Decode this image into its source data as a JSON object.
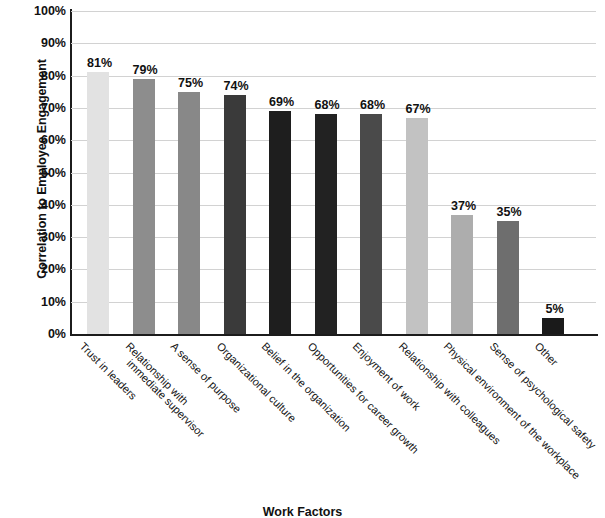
{
  "chart_data": {
    "type": "bar",
    "title": "",
    "xlabel": "Work Factors",
    "ylabel": "Correlation to Employee Engagement",
    "ylim": [
      0,
      100
    ],
    "ytick_labels": [
      "100%",
      "90%",
      "80%",
      "70%",
      "60%",
      "50%",
      "40%",
      "30%",
      "20%",
      "10%",
      "0%"
    ],
    "ytick_values": [
      100,
      90,
      80,
      70,
      60,
      50,
      40,
      30,
      20,
      10,
      0
    ],
    "grid": true,
    "legend": "none",
    "value_label_suffix": "%",
    "categories": [
      "Trust in leaders",
      "Relationship with immediate supervisor",
      "A sense of purpose",
      "Organizational culture",
      "Belief in the organization",
      "Opportunities for career growth",
      "Enjoyment of work",
      "Relationship with colleagues",
      "Physical environment of the workplace",
      "Sense of psychological safety",
      "Other"
    ],
    "values": [
      81,
      79,
      75,
      74,
      69,
      68,
      68,
      67,
      37,
      35,
      5
    ],
    "value_labels": [
      "81%",
      "79%",
      "75%",
      "74%",
      "69%",
      "68%",
      "68%",
      "67%",
      "37%",
      "35%",
      "5%"
    ],
    "bar_colors": [
      "#e2e2e2",
      "#8d8d8d",
      "#888888",
      "#3a3a3a",
      "#1e1e1e",
      "#222222",
      "#4a4a4a",
      "#c2c2c2",
      "#adadad",
      "#6e6e6e",
      "#1a1a1a"
    ],
    "axis_color": "#1c1c1c",
    "gridline_color": "#d2d2d2",
    "background_color": "#ffffff"
  }
}
